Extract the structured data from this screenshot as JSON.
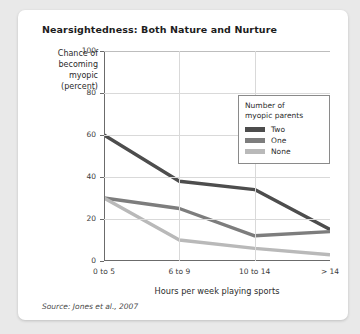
{
  "card": {
    "title": "Nearsightedness: Both Nature and Nurture",
    "source": "Source: Jones et al., 2007"
  },
  "legend": {
    "title_line1": "Number of",
    "title_line2": "myopic parents",
    "entries": [
      {
        "label": "Two",
        "color": "#4d4d4d"
      },
      {
        "label": "One",
        "color": "#7d7d7d"
      },
      {
        "label": "None",
        "color": "#b9b9b9"
      }
    ]
  },
  "ylabel_lines": {
    "l1": "Chance of",
    "l2": "becoming",
    "l3": "myopic",
    "l4": "(percent)"
  },
  "chart_data": {
    "type": "line",
    "title": "Nearsightedness: Both Nature and Nurture",
    "xlabel": "Hours per week playing sports",
    "ylabel": "Chance of becoming myopic (percent)",
    "categories": [
      "0 to 5",
      "6 to 9",
      "10 to 14",
      "> 14"
    ],
    "yticks": [
      0,
      20,
      40,
      60,
      80,
      100
    ],
    "ylim": [
      0,
      100
    ],
    "grid": true,
    "legend_position": "inside-top-right",
    "legend_title": "Number of myopic parents",
    "series": [
      {
        "name": "Two",
        "color": "#4d4d4d",
        "values": [
          60,
          38,
          34,
          15
        ]
      },
      {
        "name": "One",
        "color": "#7d7d7d",
        "values": [
          30,
          25,
          12,
          14
        ]
      },
      {
        "name": "None",
        "color": "#b9b9b9",
        "values": [
          30,
          10,
          6,
          3
        ]
      }
    ]
  }
}
